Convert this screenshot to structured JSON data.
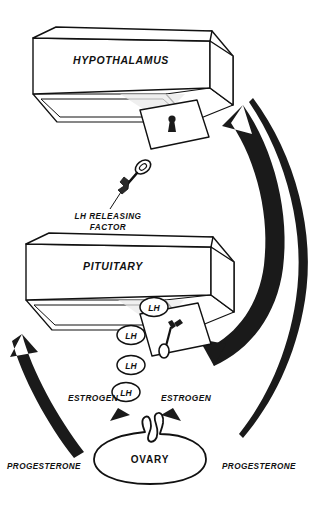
{
  "diagram": {
    "nodes": {
      "hypothalamus": "HYPOTHALAMUS",
      "pituitary": "PITUITARY",
      "ovary": "OVARY"
    },
    "labels": {
      "lh_releasing_factor_line1": "LH RELEASING",
      "lh_releasing_factor_line2": "FACTOR",
      "estrogen_left": "ESTROGEN",
      "estrogen_right": "ESTROGEN",
      "progesterone_left": "PROGESTERONE",
      "progesterone_right": "PROGESTERONE"
    },
    "hormone_tokens": [
      {
        "label": "LH"
      },
      {
        "label": "LH"
      },
      {
        "label": "LH"
      },
      {
        "label": "LH"
      }
    ],
    "icons": {
      "key_releasing_factor": "key-icon",
      "keyhole_hypothalamus": "keyhole-icon",
      "key_in_lock_pituitary": "key-in-lock-icon",
      "arrow_progesterone_left": "thick-up-arrow-icon",
      "arrow_estrogen_inner_right": "thick-curved-arrow-icon",
      "arrow_progesterone_outer_right": "thin-curved-arrow-icon",
      "arrow_estrogen_small_left": "small-arrowhead-icon",
      "arrow_estrogen_small_right": "small-arrowhead-icon"
    },
    "colors": {
      "ink": "#111111",
      "fill": "#ffffff",
      "solid": "#1a1a1a"
    }
  }
}
